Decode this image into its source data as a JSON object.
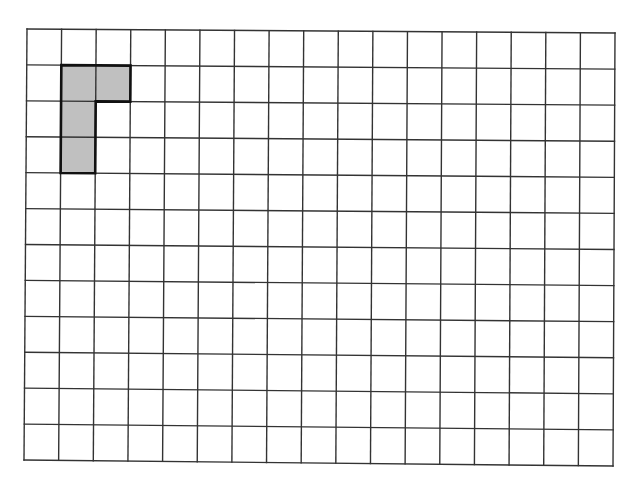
{
  "diagram": {
    "type": "grid-with-shaded-shape",
    "grid": {
      "columns": 17,
      "rows": 12,
      "corners": {
        "top_left": [
          27,
          29
        ],
        "top_right": [
          615,
          33
        ],
        "bottom_left": [
          24,
          460
        ],
        "bottom_right": [
          613,
          466
        ]
      },
      "line_color": "#333333",
      "background": "#ffffff"
    },
    "shape": {
      "name": "L-shape",
      "fill": "#c0c0c0",
      "stroke": "#111111",
      "cells": [
        [
          1,
          1
        ],
        [
          2,
          1
        ],
        [
          1,
          2
        ],
        [
          1,
          3
        ]
      ],
      "outline": [
        [
          1,
          1
        ],
        [
          3,
          1
        ],
        [
          3,
          2
        ],
        [
          2,
          2
        ],
        [
          2,
          4
        ],
        [
          1,
          4
        ]
      ]
    }
  }
}
